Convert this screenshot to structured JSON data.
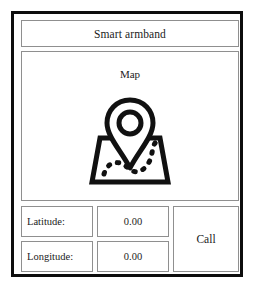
{
  "device": {
    "title": "Smart armband"
  },
  "map_panel": {
    "label": "Map",
    "icon": "map-pin-icon"
  },
  "fields": [
    {
      "label": "Latitude:",
      "value": "0.00"
    },
    {
      "label": "Longitude:",
      "value": "0.00"
    }
  ],
  "actions": {
    "call_label": "Call"
  },
  "colors": {
    "frame": "#0d0d0d",
    "panel_border": "#8f8f8f",
    "background": "#ffffff",
    "text": "#1b1b1b",
    "icon": "#111111"
  }
}
